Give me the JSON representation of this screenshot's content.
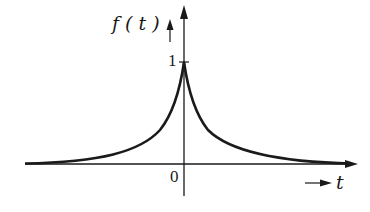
{
  "figure": {
    "y_label": "f ( t )",
    "x_label": "t",
    "origin_label": "0",
    "peak_label": "1",
    "curve": "two-sided exponential decay f(t)=e^{-a|t|}",
    "color": "#1a1a1a"
  }
}
